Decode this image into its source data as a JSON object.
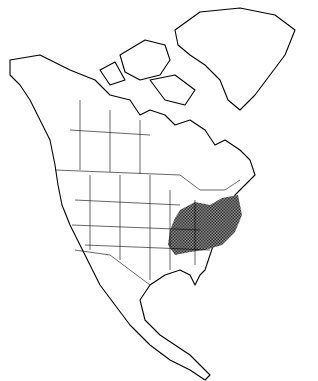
{
  "map": {
    "region": "North America",
    "type": "species range map",
    "range_description": "Shaded distribution in eastern United States (Midwest, Ohio Valley, Appalachians, Mid-Atlantic)",
    "colors": {
      "land": "#ffffff",
      "outline": "#000000",
      "range": "#555555"
    }
  }
}
